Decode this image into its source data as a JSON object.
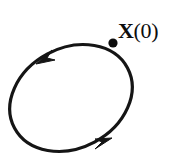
{
  "figure": {
    "type": "closed-orbit-diagram",
    "background_color": "#ffffff",
    "stroke_color": "#151515",
    "marker_color": "#0d0d0d",
    "label": {
      "vector_symbol": "X",
      "argument": "(0)",
      "full_text": "X(0)"
    },
    "orbit": {
      "shape": "ellipse",
      "center_x": 71,
      "center_y": 98,
      "radius_x": 64,
      "radius_y": 50,
      "rotation_deg": -28,
      "stroke_width": 3.2,
      "direction": "counterclockwise"
    },
    "marker": {
      "name": "initial-condition-point",
      "x": 113,
      "y": 43,
      "radius": 4.6
    },
    "arrows": [
      {
        "name": "arrow-upper-left",
        "tip_x": 36,
        "tip_y": 63,
        "direction_deg": 208
      },
      {
        "name": "arrow-lower-right",
        "tip_x": 112,
        "tip_y": 139,
        "direction_deg": 36
      }
    ]
  }
}
